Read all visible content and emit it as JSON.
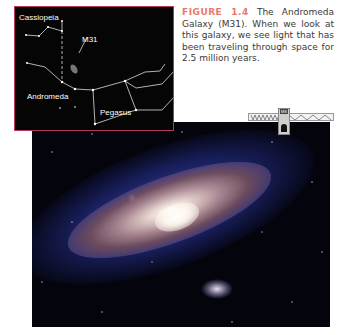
{
  "figure": {
    "label": "FIGURE 1.4",
    "caption": "The Andromeda Galaxy (M31). When we look at this galaxy, we see light that has been traveling through space for 2.5 million years."
  },
  "inset_map": {
    "labels": {
      "cassiopeia": "Cassiopeia",
      "m31": "M31",
      "andromeda": "Andromeda",
      "pegasus": "Pegasus"
    },
    "border_color": "#b5365a"
  },
  "marker": {
    "tag": "MS"
  },
  "colors": {
    "figure_label": "#e8796a",
    "caption_text": "#3a3a3a"
  }
}
